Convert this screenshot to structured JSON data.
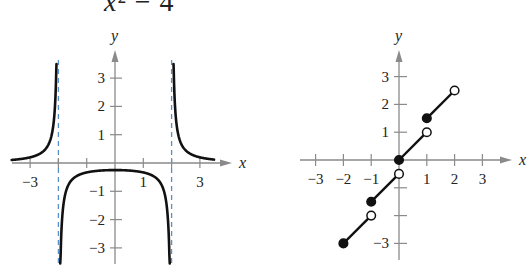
{
  "title": {
    "visible_text_var": "x",
    "visible_text_rest": "² − 4"
  },
  "chart_data": [
    {
      "type": "line",
      "title": "",
      "description": "Graph of a rational function with vertical asymptotes at x = -2 and x = 2 (consistent with f(x) = 1/(x² − 4))",
      "xlabel": "x",
      "ylabel": "y",
      "x_ticks": [
        "-3",
        "1",
        "3"
      ],
      "y_ticks": [
        "3",
        "2",
        "1",
        "-1",
        "-2",
        "-3"
      ],
      "xlim": [
        -3.7,
        4
      ],
      "ylim": [
        -3.5,
        4
      ],
      "asymptotes": {
        "vertical": [
          -2,
          2
        ],
        "style": "dashed",
        "color": "#5b8fc9"
      },
      "series": [
        {
          "name": "left branch",
          "x": [
            -3.65,
            -3.0,
            -2.5,
            -2.25,
            -2.12,
            -2.07
          ],
          "y": [
            0.11,
            0.2,
            0.44,
            0.94,
            2.02,
            3.5
          ]
        },
        {
          "name": "middle branch",
          "x": [
            -1.93,
            -1.88,
            -1.75,
            -1.5,
            -1.0,
            0.0,
            1.0,
            1.5,
            1.75,
            1.88,
            1.93
          ],
          "y": [
            -3.5,
            -2.17,
            -1.07,
            -0.57,
            -0.33,
            -0.25,
            -0.33,
            -0.57,
            -1.07,
            -2.17,
            -3.5
          ]
        },
        {
          "name": "right branch",
          "x": [
            2.07,
            2.12,
            2.25,
            2.5,
            3.0,
            3.5
          ],
          "y": [
            3.5,
            2.02,
            0.94,
            0.44,
            0.2,
            0.12
          ]
        }
      ],
      "line_color": "#111111",
      "axis_color": "#8a8a8a"
    },
    {
      "type": "line",
      "title": "",
      "description": "Step-like piecewise linear function: segments on [n, n+1) with slope 1, consistent with f(x) = x + ⌊x⌋/2",
      "xlabel": "x",
      "ylabel": "y",
      "x_ticks": [
        "-3",
        "-2",
        "-1",
        "1",
        "2",
        "3"
      ],
      "y_ticks": [
        "3",
        "2",
        "1",
        "-3"
      ],
      "xlim": [
        -3.5,
        4
      ],
      "ylim": [
        -3.5,
        4
      ],
      "segments": [
        {
          "start": [
            -2,
            -3
          ],
          "start_closed": true,
          "end": [
            -1,
            -2
          ],
          "end_closed": false
        },
        {
          "start": [
            -1,
            -1.5
          ],
          "start_closed": true,
          "end": [
            0,
            -0.5
          ],
          "end_closed": false
        },
        {
          "start": [
            0,
            0
          ],
          "start_closed": true,
          "end": [
            1,
            1
          ],
          "end_closed": false
        },
        {
          "start": [
            1,
            1.5
          ],
          "start_closed": true,
          "end": [
            2,
            2.5
          ],
          "end_closed": false
        }
      ],
      "line_color": "#111111",
      "axis_color": "#8a8a8a"
    }
  ]
}
